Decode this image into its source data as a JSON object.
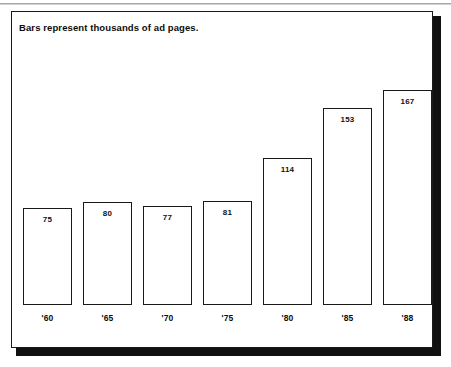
{
  "figure": {
    "title": "Bars represent thousands of ad pages.",
    "frame_color": "#1a1a1a",
    "shadow_color": "#111111",
    "background": "#ffffff"
  },
  "chart_data": {
    "type": "bar",
    "title": "Bars represent thousands of ad pages.",
    "xlabel": "",
    "ylabel": "",
    "unit": "thousands of ad pages",
    "categories": [
      "'60",
      "'65",
      "'70",
      "'75",
      "'80",
      "'85",
      "'88"
    ],
    "values": [
      75,
      80,
      77,
      81,
      114,
      153,
      167
    ],
    "value_labels": [
      "75",
      "80",
      "77",
      "81",
      "114",
      "153",
      "167"
    ],
    "ylim": [
      0,
      180
    ],
    "grid": false,
    "legend": null,
    "bar_style": {
      "fill": "#ffffff",
      "edge": "#1a1a1a",
      "label_position": "inside-top"
    }
  }
}
